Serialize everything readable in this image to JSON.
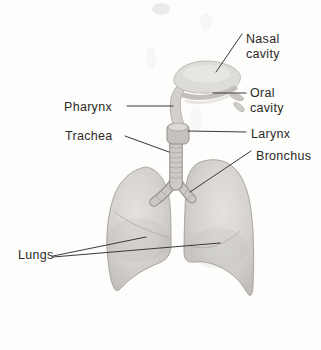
{
  "diagram": {
    "labels": {
      "nasal_line1": "Nasal",
      "nasal_line2": "cavity",
      "oral_line1": "Oral",
      "oral_line2": "cavity",
      "pharynx": "Pharynx",
      "trachea": "Trachea",
      "larynx": "Larynx",
      "bronchus": "Bronchus",
      "lungs": "Lungs"
    },
    "colors": {
      "background": "#fdfdfc",
      "label_text": "#2b2927",
      "leader_line": "#3b3937",
      "anatomy_fill_light": "#dedcd9",
      "anatomy_fill_mid": "#cdc9c5",
      "anatomy_outline": "#a29c97"
    }
  }
}
